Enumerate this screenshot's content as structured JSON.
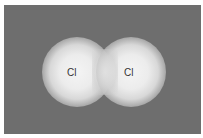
{
  "diagram": {
    "background_color": "#6e6e6e",
    "atoms": [
      {
        "label": "Cl",
        "position": "left"
      },
      {
        "label": "Cl",
        "position": "right"
      }
    ]
  }
}
